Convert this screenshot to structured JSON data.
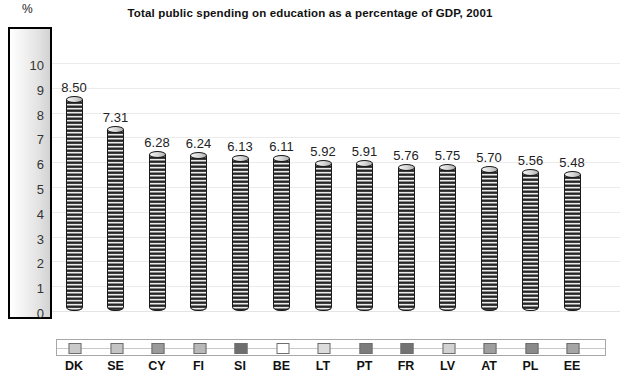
{
  "chart_data": {
    "type": "bar",
    "title": "Total public spending on education as a percentage of GDP, 2001",
    "xlabel": "",
    "ylabel": "%",
    "ylim": [
      0,
      10
    ],
    "yticks": [
      10,
      9,
      8,
      7,
      6,
      5,
      4,
      3,
      2,
      1,
      0
    ],
    "grid": true,
    "legend": "inline-swatch-strip",
    "categories": [
      "DK",
      "SE",
      "CY",
      "FI",
      "SI",
      "BE",
      "LT",
      "PT",
      "FR",
      "LV",
      "AT",
      "PL",
      "EE"
    ],
    "values": [
      8.5,
      7.31,
      6.28,
      6.24,
      6.13,
      6.11,
      5.92,
      5.91,
      5.76,
      5.75,
      5.7,
      5.56,
      5.48
    ],
    "value_labels": [
      "8.50",
      "7.31",
      "6.28",
      "6.24",
      "6.13",
      "6.11",
      "5.92",
      "5.91",
      "5.76",
      "5.75",
      "5.70",
      "5.56",
      "5.48"
    ],
    "swatch_colors": [
      "#c9c9c9",
      "#c4c4c4",
      "#9a9a9a",
      "#b8b8b8",
      "#6e6e6e",
      "#ffffff",
      "#dcdcdc",
      "#7c7c7c",
      "#737373",
      "#d2d2d2",
      "#9e9e9e",
      "#8a8a8a",
      "#a5a5a5"
    ]
  },
  "style": {
    "bar_fill_dark": "#111111",
    "bar_fill_light": "#ffffff",
    "gridline_color": "#ebebeb",
    "axis_border_color": "#000000",
    "text_color": "#111111"
  }
}
